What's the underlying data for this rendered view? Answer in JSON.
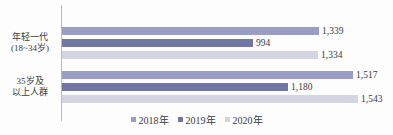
{
  "colors": {
    "series_2018": "#9a9ec4",
    "series_2019": "#7176a7",
    "series_2020": "#d3d6e2",
    "text": "#3c3c46",
    "axis_line": "#b6bac6",
    "background": "#fdfdfd"
  },
  "chart_data": {
    "type": "bar",
    "orientation": "horizontal",
    "categories": [
      "年轻一代(18~34岁)",
      "35岁及以上人群"
    ],
    "category_display_lines": [
      [
        "年轻一代",
        "(18~34岁)"
      ],
      [
        "35岁及",
        "以上人群"
      ]
    ],
    "series": [
      {
        "name": "2018年",
        "color": "#9a9ec4",
        "values": [
          1339,
          1517
        ],
        "value_labels": [
          "1,339",
          "1,517"
        ]
      },
      {
        "name": "2019年",
        "color": "#7176a7",
        "values": [
          994,
          1180
        ],
        "value_labels": [
          "994",
          "1,180"
        ]
      },
      {
        "name": "2020年",
        "color": "#d3d6e2",
        "values": [
          1334,
          1543
        ],
        "value_labels": [
          "1,334",
          "1,543"
        ]
      }
    ],
    "legend": {
      "position": "bottom",
      "entries": [
        "2018年",
        "2019年",
        "2020年"
      ]
    },
    "grid": false,
    "value_axis_visible": false,
    "title": "",
    "xlabel": "",
    "ylabel": ""
  }
}
